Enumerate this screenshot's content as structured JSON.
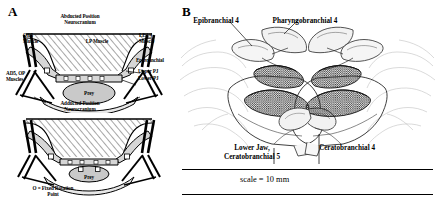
{
  "figure": {
    "panels": [
      {
        "letter": "A",
        "name": "pharyngeal-jaw-mechanics-schematic",
        "diagrams": [
          {
            "position_label": "Abducted Position",
            "structure_label": "Neurocranium",
            "prey_label": "Prey",
            "labels": [
              {
                "text": "OD5\nMuscle",
                "name": "od5-muscle"
              },
              {
                "text": "LP Muscle",
                "name": "lp-muscle"
              },
              {
                "text": "LE3/4\nMuscle",
                "name": "le34-muscle"
              },
              {
                "text": "Epibranchial",
                "name": "epibranchial"
              },
              {
                "text": "Upper PJ",
                "name": "upper-pj"
              },
              {
                "text": "Lower PJ",
                "name": "lower-pj"
              },
              {
                "text": "AD5, OP\nMuscles",
                "name": "ad5-op-muscles"
              }
            ]
          },
          {
            "position_label": "Adducted Position",
            "structure_label": "Neurocranium",
            "prey_label": "Prey"
          }
        ],
        "key": "O = Fixed Rotation\nPoint"
      },
      {
        "letter": "B",
        "name": "pharyngeal-jaw-anatomical-drawing",
        "labels": [
          {
            "text": "Epibranchial 4",
            "name": "epibranchial-4"
          },
          {
            "text": "Pharyngobranchial 4",
            "name": "pharyngobranchial-4"
          },
          {
            "text": "Lower Jaw,\nCeratobranchial 5",
            "name": "lower-jaw-ceratobranchial-5"
          },
          {
            "text": "Ceratobranchial 4",
            "name": "ceratobranchial-4"
          }
        ],
        "scale_bar": "scale = 10 mm"
      }
    ]
  },
  "colors": {
    "ink": "#000000",
    "background": "#ffffff",
    "bone_fill": "#d9d9d9",
    "prey_fill": "#c8c8c8",
    "muscle_fill": "#b8b8b8"
  }
}
